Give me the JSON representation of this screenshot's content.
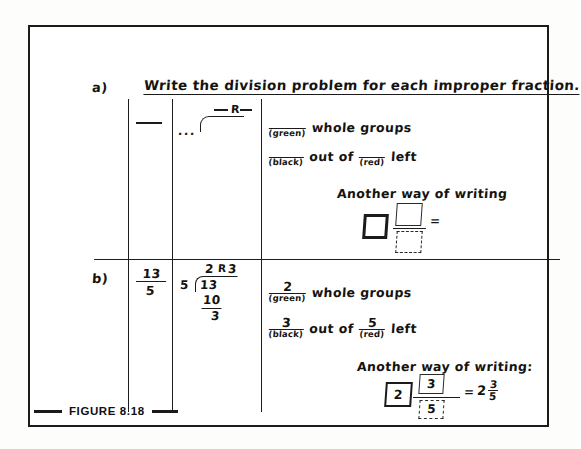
{
  "figure": {
    "caption": "FIGURE 8.18",
    "heading": "Write the division problem for each improper fraction.",
    "rows": [
      {
        "label": "a)",
        "fraction": {
          "numerator": "",
          "denominator": ""
        },
        "long_division": {
          "divisor": "",
          "dividend": "",
          "quotient": "",
          "remainder_label": "R",
          "remainder": "",
          "subtrahend": "",
          "difference": ""
        },
        "statement_1": {
          "blank_value": "",
          "blank_tag": "(green)",
          "text": "whole groups"
        },
        "statement_2": {
          "blank_value": "",
          "blank_tag": "(black)",
          "middle_text": "out of",
          "blank2_value": "",
          "blank2_tag": "(red)",
          "end_text": "left"
        },
        "another_way": {
          "title": "Another way of writing",
          "whole_box": "",
          "numerator_box": "",
          "denominator_box": "",
          "equals": "=",
          "result": ""
        }
      },
      {
        "label": "b)",
        "fraction": {
          "numerator": "13",
          "denominator": "5"
        },
        "long_division": {
          "divisor": "5",
          "dividend": "13",
          "quotient": "2",
          "remainder_label": "R",
          "remainder": "3",
          "subtrahend": "10",
          "difference": "3"
        },
        "statement_1": {
          "blank_value": "2",
          "blank_tag": "(green)",
          "text": "whole groups"
        },
        "statement_2": {
          "blank_value": "3",
          "blank_tag": "(black)",
          "middle_text": "out of",
          "blank2_value": "5",
          "blank2_tag": "(red)",
          "end_text": "left"
        },
        "another_way": {
          "title": "Another way of writing:",
          "whole_box": "2",
          "numerator_box": "3",
          "denominator_box": "5",
          "equals": "=",
          "result_whole": "2",
          "result_numerator": "3",
          "result_denominator": "5"
        }
      }
    ],
    "placeholder_dots": "...",
    "colors": {
      "ink": "#1b1b1b",
      "paper": "#ffffff"
    }
  }
}
